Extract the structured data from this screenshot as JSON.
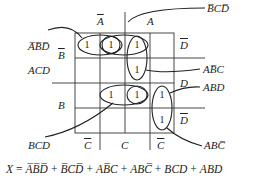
{
  "diagram": {
    "type": "karnaugh-map",
    "variables": [
      "A",
      "B",
      "C",
      "D"
    ],
    "column_labels": {
      "top": [
        {
          "text": "A",
          "overbar": true
        },
        {
          "text": "A",
          "overbar": false
        }
      ],
      "bottom": [
        {
          "text": "C",
          "overbar": true
        },
        {
          "text": "C",
          "overbar": false
        },
        {
          "text": "C",
          "overbar": true
        }
      ]
    },
    "row_labels": {
      "left": [
        {
          "text": "B",
          "overbar": true
        },
        {
          "text": "B",
          "overbar": false
        }
      ],
      "right": [
        {
          "text": "D",
          "overbar": true
        },
        {
          "text": "D",
          "overbar": false
        },
        {
          "text": "D",
          "overbar": true
        }
      ]
    },
    "cells": [
      [
        1,
        1,
        1,
        0
      ],
      [
        0,
        0,
        1,
        0
      ],
      [
        0,
        1,
        1,
        1
      ],
      [
        0,
        0,
        0,
        1
      ]
    ],
    "cell_value_label": "1",
    "group_labels": [
      {
        "id": "abd-bar",
        "parts": [
          {
            "t": "ABD",
            "ov": "ABD"
          }
        ],
        "display": "A̅B̅D̅"
      },
      {
        "id": "bcd-bar",
        "display": "B̅CD̅"
      },
      {
        "id": "acd",
        "display": "ACD"
      },
      {
        "id": "ab-bar-c",
        "display": "AB̅C"
      },
      {
        "id": "abd",
        "display": "ABD"
      },
      {
        "id": "bcd",
        "display": "BCD"
      },
      {
        "id": "abc-bar",
        "display": "ABC̅"
      }
    ],
    "equation": {
      "lhs": "X",
      "equals": "=",
      "terms": [
        "A̅B̅D̅",
        "B̅CD̅",
        "AB̅C",
        "ABC̅",
        "BCD",
        "ABD"
      ],
      "plus": "+"
    }
  }
}
